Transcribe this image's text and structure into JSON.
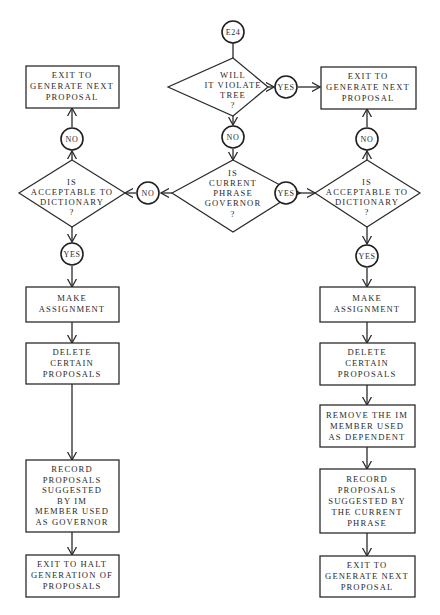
{
  "diagram": {
    "type": "flowchart",
    "entry": {
      "id": "E24",
      "label": "E24"
    },
    "labels": {
      "yes": "YES",
      "no": "NO"
    },
    "decisions": {
      "violate_tree": {
        "lines": [
          "WILL",
          "IT VIOLATE",
          "TREE",
          "?"
        ]
      },
      "phrase_governor": {
        "lines": [
          "IS",
          "CURRENT",
          "PHRASE",
          "GOVERNOR",
          "?"
        ]
      },
      "left_dictionary": {
        "lines": [
          "IS",
          "ACCEPTABLE TO",
          "DICTIONARY",
          "?"
        ]
      },
      "right_dictionary": {
        "lines": [
          "IS",
          "ACCEPTABLE TO",
          "DICTIONARY",
          "?"
        ]
      }
    },
    "processes": {
      "top_right_exit": {
        "lines": [
          "EXIT TO",
          "GENERATE NEXT",
          "PROPOSAL"
        ]
      },
      "top_left_exit": {
        "lines": [
          "EXIT TO",
          "GENERATE NEXT",
          "PROPOSAL"
        ]
      },
      "left_make": {
        "lines": [
          "MAKE",
          "ASSIGNMENT"
        ]
      },
      "left_delete": {
        "lines": [
          "DELETE",
          "CERTAIN",
          "PROPOSALS"
        ]
      },
      "left_record": {
        "lines": [
          "RECORD",
          "PROPOSALS",
          "SUGGESTED",
          "BY IM",
          "MEMBER USED",
          "AS GOVERNOR"
        ]
      },
      "left_exit": {
        "lines": [
          "EXIT TO HALT",
          "GENERATION OF",
          "PROPOSALS"
        ]
      },
      "right_make": {
        "lines": [
          "MAKE",
          "ASSIGNMENT"
        ]
      },
      "right_delete": {
        "lines": [
          "DELETE",
          "CERTAIN",
          "PROPOSALS"
        ]
      },
      "right_remove": {
        "lines": [
          "REMOVE THE IM",
          "MEMBER USED",
          "AS DEPENDENT"
        ]
      },
      "right_record": {
        "lines": [
          "RECORD",
          "PROPOSALS",
          "SUGGESTED BY",
          "THE CURRENT",
          "PHRASE"
        ]
      },
      "right_exit": {
        "lines": [
          "EXIT TO",
          "GENERATE NEXT",
          "PROPOSAL"
        ]
      }
    },
    "edges": [
      {
        "from": "E24",
        "to": "violate_tree"
      },
      {
        "from": "violate_tree",
        "to": "top_right_exit",
        "label": "YES"
      },
      {
        "from": "violate_tree",
        "to": "phrase_governor",
        "label": "NO"
      },
      {
        "from": "phrase_governor",
        "to": "left_dictionary",
        "label": "NO"
      },
      {
        "from": "phrase_governor",
        "to": "right_dictionary",
        "label": "YES"
      },
      {
        "from": "left_dictionary",
        "to": "top_left_exit",
        "label": "NO"
      },
      {
        "from": "left_dictionary",
        "to": "left_make",
        "label": "YES"
      },
      {
        "from": "left_make",
        "to": "left_delete"
      },
      {
        "from": "left_delete",
        "to": "left_record"
      },
      {
        "from": "left_record",
        "to": "left_exit"
      },
      {
        "from": "right_dictionary",
        "to": "top_right_exit",
        "label": "NO"
      },
      {
        "from": "right_dictionary",
        "to": "right_make",
        "label": "YES"
      },
      {
        "from": "right_make",
        "to": "right_delete"
      },
      {
        "from": "right_delete",
        "to": "right_remove"
      },
      {
        "from": "right_remove",
        "to": "right_record"
      },
      {
        "from": "right_record",
        "to": "right_exit"
      }
    ]
  }
}
